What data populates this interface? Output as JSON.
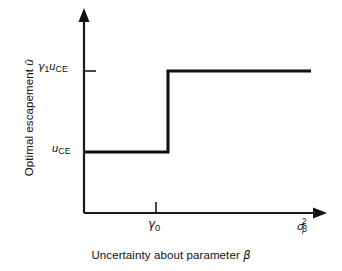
{
  "chart_data": {
    "type": "line",
    "title": "",
    "subtitle": "",
    "xlabel": "Uncertainty about parameter β",
    "ylabel": "Optimal escapement û",
    "grid": false,
    "legend": null,
    "annotations": [],
    "x_axis": {
      "arrow": true,
      "end_label": "σ²β",
      "end_label_parts": {
        "base": "σ",
        "superscript": "2",
        "subscript": "β"
      },
      "ticks": [
        {
          "label": "γ₀",
          "value": "gamma_0",
          "x_px": 156
        }
      ],
      "range_px": [
        84,
        325
      ]
    },
    "y_axis": {
      "arrow": true,
      "ticks": [
        {
          "label": "γ₁u_CE",
          "value": "gamma_1_u_CE",
          "y_px": 71
        },
        {
          "label": "u_CE",
          "value": "u_CE",
          "y_px": 152
        }
      ],
      "range_px": [
        213,
        10
      ]
    },
    "series": [
      {
        "name": "Optimal escapement step function",
        "shape": "step",
        "points": [
          {
            "x": "0",
            "y": "u_CE",
            "x_px": 84,
            "y_px": 152
          },
          {
            "x": "gamma_0",
            "y": "u_CE",
            "x_px": 168,
            "y_px": 152
          },
          {
            "x": "gamma_0",
            "y": "gamma_1_u_CE",
            "x_px": 168,
            "y_px": 71
          },
          {
            "x": "sigma_beta_sq_max",
            "y": "gamma_1_u_CE",
            "x_px": 311,
            "y_px": 71
          }
        ]
      }
    ],
    "colors": {
      "background": "#ffffff",
      "axis": "#1a1a1a",
      "curve": "#111111",
      "text": "#111111"
    }
  },
  "labels": {
    "y_tick_upper": {
      "gamma": "γ",
      "gamma_sub": "1",
      "u": "u",
      "u_sub": "CE"
    },
    "y_tick_lower": {
      "u": "u",
      "u_sub": "CE"
    },
    "x_tick_gamma0": {
      "gamma": "γ",
      "gamma_sub": "0"
    },
    "x_end": {
      "sigma": "σ",
      "sup": "2",
      "sub": "β"
    },
    "x_title_text": "Uncertainty about parameter ",
    "x_title_symbol": "β",
    "y_title_text": "Optimal escapement ",
    "y_title_symbol": "û"
  }
}
